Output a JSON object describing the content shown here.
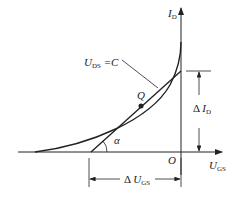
{
  "diagram": {
    "type": "transfer-characteristic",
    "y_axis": {
      "symbol": "I",
      "subscript": "D"
    },
    "x_axis": {
      "symbol": "U",
      "subscript": "GS"
    },
    "origin": "O",
    "curve_label": {
      "symbol": "U",
      "subscript": "DS",
      "rest": " =C"
    },
    "point": "Q",
    "angle": "α",
    "delta_i": {
      "prefix": "Δ ",
      "symbol": "I",
      "subscript": "D"
    },
    "delta_u": {
      "prefix": "Δ ",
      "symbol": "U",
      "subscript": "GS"
    }
  }
}
